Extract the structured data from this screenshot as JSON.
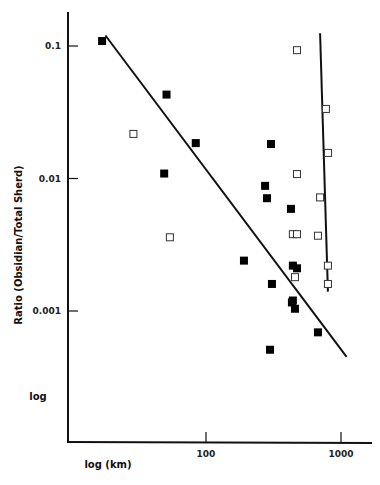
{
  "chart_data": {
    "type": "scatter",
    "title": "",
    "xlabel": "log (km)",
    "ylabel": "Ratio (Obsidian/Total Sherd)",
    "corner_label": "log",
    "xscale": "log",
    "yscale": "log",
    "xlim": [
      10,
      1500
    ],
    "ylim": [
      0.0002,
      0.16
    ],
    "x_ticks": [
      {
        "value": 100,
        "label": "100"
      },
      {
        "value": 1000,
        "label": "1000"
      }
    ],
    "y_ticks": [
      {
        "value": 0.1,
        "label": "0.1"
      },
      {
        "value": 0.01,
        "label": "0.01"
      },
      {
        "value": 0.001,
        "label": "0.001"
      }
    ],
    "grid": false,
    "legend": null,
    "series": [
      {
        "name": "filled-squares",
        "marker": "filled-square",
        "points": [
          {
            "x": 17,
            "y": 0.109
          },
          {
            "x": 51,
            "y": 0.043
          },
          {
            "x": 84,
            "y": 0.0185
          },
          {
            "x": 49,
            "y": 0.0109
          },
          {
            "x": 303,
            "y": 0.0182
          },
          {
            "x": 274,
            "y": 0.0088
          },
          {
            "x": 283,
            "y": 0.0071
          },
          {
            "x": 426,
            "y": 0.0059
          },
          {
            "x": 191,
            "y": 0.0024
          },
          {
            "x": 440,
            "y": 0.0022
          },
          {
            "x": 472,
            "y": 0.0021
          },
          {
            "x": 308,
            "y": 0.0016
          },
          {
            "x": 440,
            "y": 0.0012
          },
          {
            "x": 433,
            "y": 0.00116
          },
          {
            "x": 456,
            "y": 0.00104
          },
          {
            "x": 675,
            "y": 0.00069
          },
          {
            "x": 298,
            "y": 0.00051
          }
        ]
      },
      {
        "name": "open-squares",
        "marker": "open-square",
        "points": [
          {
            "x": 472,
            "y": 0.093
          },
          {
            "x": 29,
            "y": 0.0217
          },
          {
            "x": 773,
            "y": 0.0335
          },
          {
            "x": 802,
            "y": 0.0156
          },
          {
            "x": 472,
            "y": 0.0108
          },
          {
            "x": 700,
            "y": 0.0072
          },
          {
            "x": 54,
            "y": 0.0036
          },
          {
            "x": 440,
            "y": 0.0038
          },
          {
            "x": 472,
            "y": 0.0038
          },
          {
            "x": 675,
            "y": 0.0037
          },
          {
            "x": 800,
            "y": 0.0022
          },
          {
            "x": 456,
            "y": 0.0018
          },
          {
            "x": 800,
            "y": 0.0016
          }
        ]
      }
    ],
    "fit_lines": [
      {
        "name": "filled-trend",
        "from": {
          "x": 18,
          "y": 0.12
        },
        "to": {
          "x": 1100,
          "y": 0.00045
        }
      },
      {
        "name": "open-trend",
        "from": {
          "x": 700,
          "y": 0.125
        },
        "to": {
          "x": 800,
          "y": 0.0014
        }
      }
    ]
  }
}
